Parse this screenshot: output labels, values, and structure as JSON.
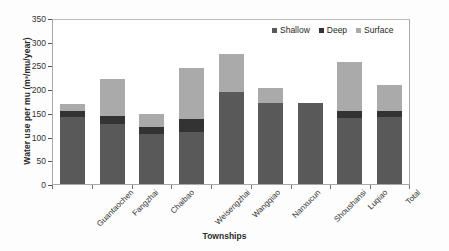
{
  "chart_data": {
    "type": "bar",
    "stacked": true,
    "title": "",
    "xlabel": "Townships",
    "ylabel": "Water use per mu (m³/mu/year)",
    "ylim": [
      0,
      350
    ],
    "yticks": [
      0,
      50,
      100,
      150,
      200,
      250,
      300,
      350
    ],
    "grid": false,
    "legend_position": "top-right",
    "categories": [
      "Guantaochen",
      "Fangzhai",
      "Chaibao",
      "Weisengzhai",
      "Wangqiao",
      "Nanxucun",
      "Shoushansi",
      "Luqiao",
      "Total"
    ],
    "series": [
      {
        "name": "Shallow",
        "color": "#595959",
        "values": [
          141,
          127,
          106,
          110,
          194,
          171,
          170,
          139,
          142
        ]
      },
      {
        "name": "Deep",
        "color": "#333333",
        "values": [
          12,
          16,
          14,
          27,
          0,
          0,
          0,
          15,
          12
        ]
      },
      {
        "name": "Surface",
        "color": "#aaaaaa",
        "values": [
          16,
          78,
          27,
          108,
          81,
          31,
          0,
          104,
          55
        ]
      }
    ],
    "totals": [
      169,
      221,
      147,
      245,
      275,
      202,
      170,
      258,
      209
    ]
  },
  "legend": {
    "items": [
      {
        "label": "Shallow",
        "color": "#595959"
      },
      {
        "label": "Deep",
        "color": "#333333"
      },
      {
        "label": "Surface",
        "color": "#aaaaaa"
      }
    ]
  }
}
